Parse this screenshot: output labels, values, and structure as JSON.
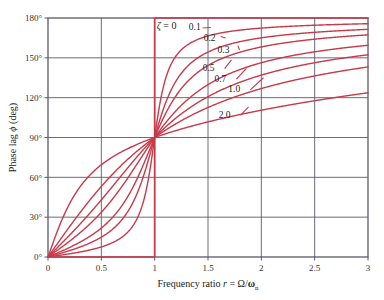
{
  "chart_data": {
    "type": "line",
    "title": "",
    "xlabel": "Frequency ratio r = Ω/ωₙ",
    "xlabel_parts": {
      "text": "Frequency ratio ",
      "var": "r",
      "eq": " = ",
      "ratio_num": "Ω",
      "ratio_slash": "/",
      "ratio_den": "ω",
      "ratio_sub": "n"
    },
    "ylabel": "Phase lag ϕ (deg)",
    "ylabel_parts": {
      "text1": "Phase lag ",
      "var": "ϕ",
      "text2": " (deg)"
    },
    "xlim": [
      0,
      3
    ],
    "ylim": [
      0,
      180
    ],
    "xticks": [
      "0",
      "0.5",
      "1",
      "1.5",
      "2",
      "2.5",
      "3"
    ],
    "xtick_values": [
      0,
      0.5,
      1,
      1.5,
      2,
      2.5,
      3
    ],
    "yticks": [
      "0°",
      "30°",
      "60°",
      "90°",
      "120°",
      "150°",
      "180°"
    ],
    "ytick_values": [
      0,
      30,
      60,
      90,
      120,
      150,
      180
    ],
    "grid": true,
    "grid_color": "#5a5a6e",
    "curve_color": "#c8394a",
    "legend_position": "inline-labels",
    "formula": "phi = atan2(2*zeta*r, 1 - r^2)",
    "series": [
      {
        "name": "ζ = 0",
        "zeta": 0,
        "label": "ζ = 0",
        "label_x": 1.02,
        "label_y": 172,
        "label_anchor": "start",
        "leader": false,
        "endpoint_y": 180
      },
      {
        "name": "0.1",
        "zeta": 0.1,
        "label": "0.1",
        "label_x": 1.32,
        "label_y": 171,
        "label_anchor": "start",
        "leader": true,
        "leader_to_x": 1.45,
        "leader_to_y": 172.5,
        "endpoint_y": 178.6
      },
      {
        "name": "0.2",
        "zeta": 0.2,
        "label": "0.2",
        "label_x": 1.46,
        "label_y": 163,
        "label_anchor": "start",
        "leader": true,
        "leader_to_x": 1.62,
        "leader_to_y": 166.0,
        "endpoint_y": 177.1
      },
      {
        "name": "0.3",
        "zeta": 0.3,
        "label": "0.3",
        "label_x": 1.59,
        "label_y": 154,
        "label_anchor": "start",
        "leader": true,
        "leader_to_x": 1.78,
        "leader_to_y": 159.2,
        "endpoint_y": 175.7
      },
      {
        "name": "0.5",
        "zeta": 0.5,
        "label": "0.5",
        "label_x": 1.45,
        "label_y": 140,
        "label_anchor": "start",
        "leader": true,
        "leader_to_x": 1.72,
        "leader_to_y": 148.5,
        "endpoint_y": 172.9
      },
      {
        "name": "0.7",
        "zeta": 0.7,
        "label": "0.7",
        "label_x": 1.56,
        "label_y": 132,
        "label_anchor": "start",
        "leader": true,
        "leader_to_x": 1.86,
        "leader_to_y": 142.1,
        "endpoint_y": 170.2
      },
      {
        "name": "1.0",
        "zeta": 1.0,
        "label": "1.0",
        "label_x": 1.69,
        "label_y": 124,
        "label_anchor": "start",
        "leader": true,
        "leader_to_x": 2.02,
        "leader_to_y": 135.0,
        "endpoint_y": 165.1
      },
      {
        "name": "2.0",
        "zeta": 2.0,
        "label": "2.0",
        "label_x": 1.6,
        "label_y": 105,
        "label_anchor": "start",
        "leader": true,
        "leader_to_x": 1.88,
        "leader_to_y": 113.0,
        "endpoint_y": 143.1
      }
    ]
  },
  "axes": {
    "x_axis_name": "frequency-ratio-axis",
    "y_axis_name": "phase-lag-axis"
  }
}
